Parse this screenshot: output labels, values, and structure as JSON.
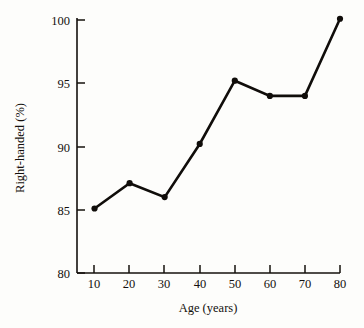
{
  "chart_data": {
    "type": "line",
    "title": "",
    "xlabel": "Age (years)",
    "ylabel": "Right-handed (%)",
    "x": [
      10,
      20,
      30,
      40,
      50,
      60,
      70,
      80
    ],
    "values": [
      85.1,
      87.1,
      86.0,
      90.2,
      95.2,
      94.0,
      94.0,
      100.1
    ],
    "series": [
      {
        "name": "Right-handed (%)",
        "values": [
          85.1,
          87.1,
          86.0,
          90.2,
          95.2,
          94.0,
          94.0,
          100.1
        ]
      }
    ],
    "xlim": [
      5,
      80
    ],
    "ylim": [
      80,
      100
    ],
    "xticks": [
      10,
      20,
      30,
      40,
      50,
      60,
      70,
      80
    ],
    "yticks": [
      80,
      85,
      90,
      95,
      100
    ],
    "xtick_labels": [
      "10",
      "20",
      "30",
      "40",
      "50",
      "60",
      "70",
      "80"
    ],
    "ytick_labels": [
      "80",
      "85",
      "90",
      "95",
      "100"
    ],
    "grid": false,
    "legend": false,
    "legend_position": "none",
    "tick_direction": "in",
    "marker": "circle",
    "line_color": "#100d0a",
    "marker_color": "#100d0a",
    "background_color": "#fdfdfb",
    "axis_color": "#14100d"
  }
}
